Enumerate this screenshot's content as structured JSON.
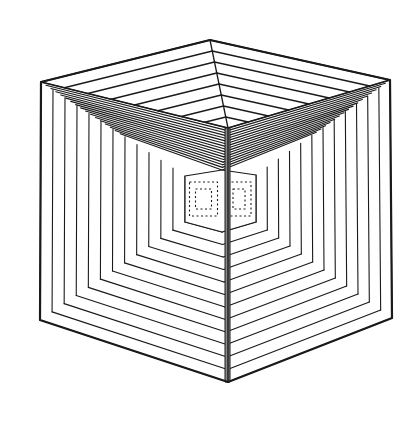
{
  "figure": {
    "stroke_color": "#1a1a1a",
    "background": "#ffffff",
    "spine_color": "#8a8a8a",
    "outer_hexagon": {
      "top": [
        210,
        40
      ],
      "top_right": [
        390,
        80
      ],
      "bottom_right": [
        392,
        318
      ],
      "bottom": [
        228,
        382
      ],
      "bottom_left": [
        40,
        320
      ],
      "top_left": [
        41,
        82
      ]
    },
    "apex_center": [
      228,
      128
    ],
    "inner_square": {
      "top_left": [
        185,
        176
      ],
      "top_right": [
        256,
        175
      ],
      "bottom_right": [
        256,
        222
      ],
      "bottom_left": [
        185,
        222
      ],
      "top_center": [
        222,
        170
      ],
      "bottom_center": [
        222,
        232
      ]
    },
    "band_counts": {
      "top_face": 7,
      "upper_wings": 16,
      "side_faces": 12,
      "bottom_faces": 12
    }
  }
}
